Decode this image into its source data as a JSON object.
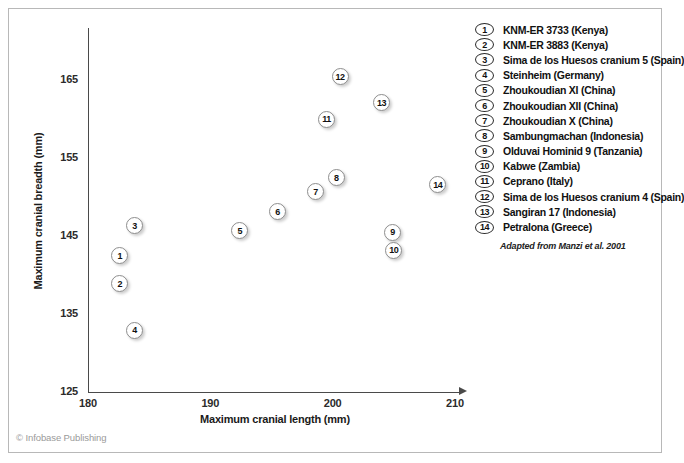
{
  "figure": {
    "copyright": "© Infobase Publishing",
    "source_note": "Adapted from Manzi et al. 2001"
  },
  "legend": {
    "items": [
      {
        "num": "1",
        "label": "KNM-ER 3733 (Kenya)"
      },
      {
        "num": "2",
        "label": "KNM-ER 3883 (Kenya)"
      },
      {
        "num": "3",
        "label": "Sima de los Huesos cranium 5 (Spain)"
      },
      {
        "num": "4",
        "label": "Steinheim (Germany)"
      },
      {
        "num": "5",
        "label": "Zhoukoudian XI (China)"
      },
      {
        "num": "6",
        "label": "Zhoukoudian XII (China)"
      },
      {
        "num": "7",
        "label": "Zhoukoudian X (China)"
      },
      {
        "num": "8",
        "label": "Sambungmachan (Indonesia)"
      },
      {
        "num": "9",
        "label": "Olduvai Hominid 9 (Tanzania)"
      },
      {
        "num": "10",
        "label": "Kabwe (Zambia)"
      },
      {
        "num": "11",
        "label": "Ceprano (Italy)"
      },
      {
        "num": "12",
        "label": "Sima de los Huesos cranium 4 (Spain)"
      },
      {
        "num": "13",
        "label": "Sangiran 17 (Indonesia)"
      },
      {
        "num": "14",
        "label": "Petralona (Greece)"
      }
    ]
  },
  "chart_data": {
    "type": "scatter",
    "title": "",
    "xlabel": "Maximum cranial length (mm)",
    "ylabel": "Maximum cranial breadth (mm)",
    "xlim": [
      180,
      210
    ],
    "ylim": [
      125,
      167.5
    ],
    "xticks": [
      180,
      190,
      200,
      210
    ],
    "yticks": [
      125,
      135,
      145,
      155,
      165
    ],
    "grid": false,
    "legend_position": "right",
    "point_label_key": "num",
    "points": [
      {
        "num": "1",
        "name": "KNM-ER 3733 (Kenya)",
        "x": 182.6,
        "y": 142.5
      },
      {
        "num": "2",
        "name": "KNM-ER 3883 (Kenya)",
        "x": 182.6,
        "y": 138.9
      },
      {
        "num": "3",
        "name": "Sima de los Huesos cranium 5 (Spain)",
        "x": 183.8,
        "y": 146.3
      },
      {
        "num": "4",
        "name": "Steinheim (Germany)",
        "x": 183.8,
        "y": 132.9
      },
      {
        "num": "5",
        "name": "Zhoukoudian XI (China)",
        "x": 192.4,
        "y": 145.7
      },
      {
        "num": "6",
        "name": "Zhoukoudian XII (China)",
        "x": 195.5,
        "y": 148.1
      },
      {
        "num": "7",
        "name": "Zhoukoudian X (China)",
        "x": 198.6,
        "y": 150.7
      },
      {
        "num": "8",
        "name": "Sambungmachan (Indonesia)",
        "x": 200.3,
        "y": 152.5
      },
      {
        "num": "9",
        "name": "Olduvai Hominid 9 (Tanzania)",
        "x": 204.9,
        "y": 145.5
      },
      {
        "num": "10",
        "name": "Kabwe (Zambia)",
        "x": 205.0,
        "y": 143.2
      },
      {
        "num": "11",
        "name": "Ceprano (Italy)",
        "x": 199.5,
        "y": 160.0
      },
      {
        "num": "12",
        "name": "Sima de los Huesos cranium 4 (Spain)",
        "x": 200.6,
        "y": 165.4
      },
      {
        "num": "13",
        "name": "Sangiran 17 (Indonesia)",
        "x": 204.0,
        "y": 162.1
      },
      {
        "num": "14",
        "name": "Petralona (Greece)",
        "x": 208.6,
        "y": 151.6
      }
    ]
  }
}
